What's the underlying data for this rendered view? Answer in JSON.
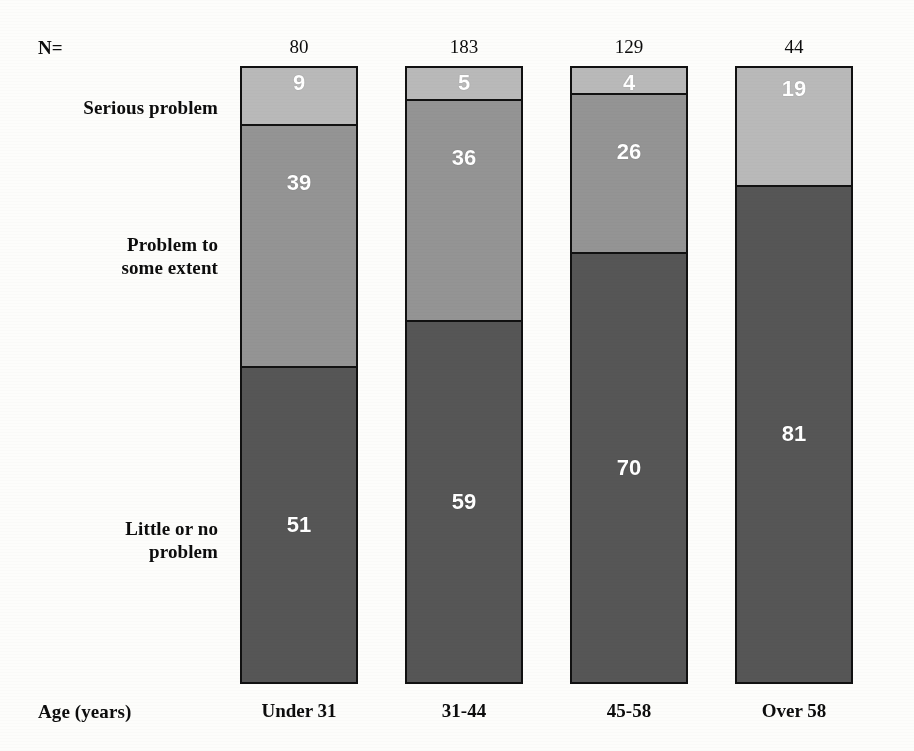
{
  "labels": {
    "n_prefix": "N=",
    "axis_label": "Age (years)",
    "legend_serious": "Serious problem",
    "legend_some_line1": "Problem to",
    "legend_some_line2": "some extent",
    "legend_little_line1": "Little or no",
    "legend_little_line2": "problem"
  },
  "colors": {
    "serious": "#b9b9b9",
    "some_extent": "#949494",
    "little_or_none": "#565656",
    "border": "#111111",
    "value_text": "#ffffff",
    "background": "#fdfdfb"
  },
  "chart_data": {
    "type": "bar",
    "title": "",
    "xlabel": "Age (years)",
    "ylabel": "",
    "ylim": [
      0,
      100
    ],
    "stacked": true,
    "grid": false,
    "legend_position": "left",
    "categories": [
      "Under 31",
      "31-44",
      "45-58",
      "Over 58"
    ],
    "sample_sizes": [
      80,
      183,
      129,
      44
    ],
    "series": [
      {
        "name": "Serious problem",
        "values": [
          9,
          5,
          4,
          19
        ]
      },
      {
        "name": "Problem to some extent",
        "values": [
          39,
          36,
          26,
          null
        ]
      },
      {
        "name": "Little or no problem",
        "values": [
          51,
          59,
          70,
          81
        ]
      }
    ],
    "bars": [
      {
        "category": "Under 31",
        "n": 80,
        "segments": [
          {
            "key": "serious",
            "label": "Serious problem",
            "value": 9,
            "display": "9"
          },
          {
            "key": "some",
            "label": "Problem to some extent",
            "value": 39,
            "display": "39"
          },
          {
            "key": "little",
            "label": "Little or no problem",
            "value": 51,
            "display": "51"
          }
        ]
      },
      {
        "category": "31-44",
        "n": 183,
        "segments": [
          {
            "key": "serious",
            "label": "Serious problem",
            "value": 5,
            "display": "5"
          },
          {
            "key": "some",
            "label": "Problem to some extent",
            "value": 36,
            "display": "36"
          },
          {
            "key": "little",
            "label": "Little or no problem",
            "value": 59,
            "display": "59"
          }
        ]
      },
      {
        "category": "45-58",
        "n": 129,
        "segments": [
          {
            "key": "serious",
            "label": "Serious problem",
            "value": 4,
            "display": "4"
          },
          {
            "key": "some",
            "label": "Problem to some extent",
            "value": 26,
            "display": "26"
          },
          {
            "key": "little",
            "label": "Little or no problem",
            "value": 70,
            "display": "70"
          }
        ]
      },
      {
        "category": "Over 58",
        "n": 44,
        "segments": [
          {
            "key": "serious",
            "label": "Serious problem",
            "value": 19,
            "display": "19"
          },
          {
            "key": "little",
            "label": "Little or no problem",
            "value": 81,
            "display": "81"
          }
        ]
      }
    ]
  }
}
